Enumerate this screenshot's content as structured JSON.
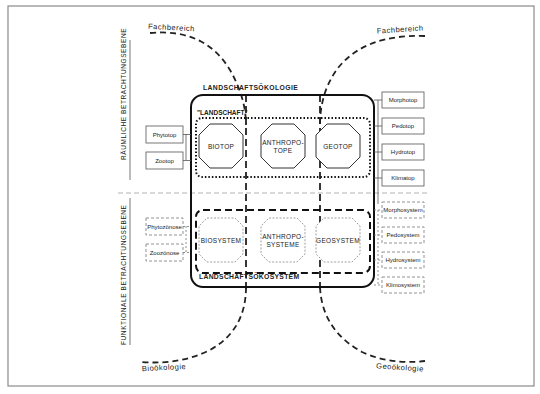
{
  "title_top": "LANDSCHAFTSÖKOLOGIE",
  "title_bottom": "LANDSCHAFTSÖKOSYSTEM",
  "landschaft_label": "\"LANDSCHAFT\"",
  "axis_labels": {
    "upper": "RÄUMLICHE BETRACHTUNGSEBENE",
    "lower": "FUNKTIONALE BETRACHTUNGSEBENE"
  },
  "arc_labels": {
    "top_left": "Fachbereich",
    "top_right": "Fachbereich",
    "bottom_left": "Bioökologie",
    "bottom_right": "Geoökologie"
  },
  "upper_units": [
    {
      "line1": "BIOTOP",
      "line2": ""
    },
    {
      "line1": "ANTHROPO-",
      "line2": "TOPE"
    },
    {
      "line1": "GEOTOP",
      "line2": ""
    }
  ],
  "lower_units": [
    {
      "line1": "BIOSYSTEM",
      "line2": ""
    },
    {
      "line1": "ANTHROPO-",
      "line2": "SYSTEME"
    },
    {
      "line1": "GEOSYSTEM",
      "line2": ""
    }
  ],
  "left_upper_boxes": [
    "Phytotop",
    "Zootop"
  ],
  "left_lower_boxes": [
    "Phytozönose",
    "Zoozönose"
  ],
  "right_upper_boxes": [
    "Morphotop",
    "Pedotop",
    "Hydrotop",
    "Klimatop"
  ],
  "right_lower_boxes": [
    "Morphosystem",
    "Pedosystem",
    "Hydrosystem",
    "Klimosystem"
  ],
  "colors": {
    "ink": "#222222",
    "frame": "#8a8a8a",
    "divider": "#a0a0a0",
    "light_box": "#777777"
  }
}
